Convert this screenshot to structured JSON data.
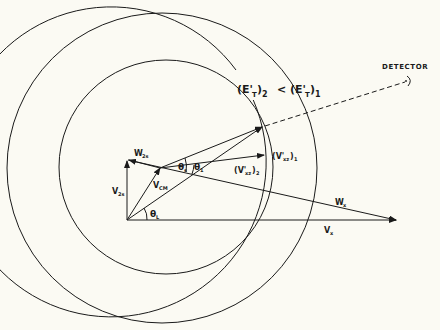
{
  "diagram": {
    "type": "velocity-vector-diagram",
    "labels": {
      "detector": "DETECTOR",
      "energy_relation": "(E'T)2 < (E'T)1",
      "energy_left": "(E'",
      "energy_left_sub": "T",
      "energy_left_close": ")",
      "energy_left_index": "2",
      "less_than": "<",
      "energy_right": "(E'",
      "energy_right_sub": "T",
      "energy_right_close": ")",
      "energy_right_index": "1",
      "w_2s": "W",
      "w_2s_sub": "2s",
      "v_2s": "V",
      "v_2s_sub": "2s",
      "v_cm": "V",
      "v_cm_sub": "CM",
      "theta_s": "θ",
      "theta_s_sub": "s",
      "theta_1": "θ",
      "theta_1_sub": "1",
      "theta_l": "θ",
      "theta_l_sub": "L",
      "v_xz_2": "(V'",
      "v_xz_2_sub": "xz",
      "v_xz_2_close": ")",
      "v_xz_2_index": "2",
      "v_xz_1": "(V'",
      "v_xz_1_sub": "xz",
      "v_xz_1_close": ")",
      "v_xz_1_index": "1",
      "w_x": "W",
      "w_x_sub": "x",
      "v_x": "V",
      "v_x_sub": "x"
    },
    "colors": {
      "line": "#1a1a1a",
      "background": "#fbfaf3"
    }
  }
}
